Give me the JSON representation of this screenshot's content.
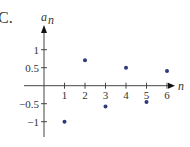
{
  "panel_label": "C.",
  "chart_data": {
    "type": "scatter",
    "title": "",
    "xlabel": "n",
    "ylabel": "a_n",
    "ylabel_display": "a",
    "ylabel_sub": "n",
    "x": [
      1,
      2,
      3,
      4,
      5,
      6
    ],
    "values": [
      -1.0,
      0.71,
      -0.58,
      0.5,
      -0.45,
      0.41
    ],
    "series": [
      {
        "name": "a_n",
        "x": [
          1,
          2,
          3,
          4,
          5,
          6
        ],
        "values": [
          -1.0,
          0.71,
          -0.58,
          0.5,
          -0.45,
          0.41
        ]
      }
    ],
    "xticks": [
      "1",
      "2",
      "3",
      "4",
      "5",
      "6"
    ],
    "yticks": [
      {
        "value": 1,
        "label": "1"
      },
      {
        "value": 0.5,
        "label": "0.5"
      },
      {
        "value": -0.5,
        "label": "−0.5"
      },
      {
        "value": -1,
        "label": "−1"
      }
    ],
    "xlim": [
      -0.4,
      6.5
    ],
    "ylim": [
      -1.4,
      1.7
    ],
    "grid": false,
    "legend": "none",
    "marker_color": "#2e3a7a",
    "axis_color": "#444444"
  }
}
